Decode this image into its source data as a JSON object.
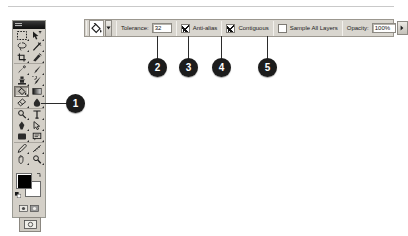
{
  "app": {
    "name": "Adobe Photoshop",
    "toolbox_title": "Toolbox"
  },
  "options_bar": {
    "tool_preset_icon": "paint-bucket-icon",
    "tool_preset_arrow_glyph": "▼",
    "tolerance": {
      "label": "Tolerance:",
      "value": "32"
    },
    "anti_alias": {
      "label": "Anti-alias",
      "checked": true
    },
    "contiguous": {
      "label": "Contiguous",
      "checked": true
    },
    "sample_all_layers": {
      "label": "Sample All Layers",
      "checked": false
    },
    "opacity": {
      "label": "Opacity:",
      "value": "100%",
      "arrow_glyph": "▶"
    }
  },
  "toolbox": {
    "selected_tool": "paint-bucket-tool",
    "groups": [
      {
        "rows": [
          {
            "tools": [
              "marquee-tool",
              "move-tool"
            ]
          },
          {
            "tools": [
              "lasso-tool",
              "magic-wand-tool"
            ]
          },
          {
            "tools": [
              "crop-tool",
              "slice-tool"
            ]
          }
        ]
      },
      {
        "rows": [
          {
            "tools": [
              "healing-brush-tool",
              "brush-tool"
            ]
          },
          {
            "tools": [
              "clone-stamp-tool",
              "history-brush-tool"
            ]
          },
          {
            "tools": [
              "paint-bucket-tool",
              "gradient-tool"
            ]
          },
          {
            "tools": [
              "eraser-tool",
              "blur-tool"
            ]
          }
        ]
      },
      {
        "rows": [
          {
            "tools": [
              "dodge-tool",
              "type-tool"
            ]
          },
          {
            "tools": [
              "pen-tool",
              "path-selection-tool"
            ]
          },
          {
            "tools": [
              "shape-tool",
              "notes-tool"
            ]
          }
        ]
      },
      {
        "rows": [
          {
            "tools": [
              "eyedropper-tool",
              "measure-tool"
            ]
          },
          {
            "tools": [
              "hand-tool",
              "zoom-tool"
            ]
          }
        ]
      }
    ],
    "foreground_color": "#000000",
    "background_color": "#ffffff",
    "quick_mask_icons": [
      "standard-mode-icon",
      "quick-mask-mode-icon"
    ],
    "screen_mode_icon": "screen-mode-icon"
  },
  "callouts": [
    {
      "number": "1",
      "target": "paint-bucket-tool"
    },
    {
      "number": "2",
      "target": "tolerance-field"
    },
    {
      "number": "3",
      "target": "anti-alias-checkbox"
    },
    {
      "number": "4",
      "target": "contiguous-checkbox"
    },
    {
      "number": "5",
      "target": "sample-all-layers-checkbox"
    }
  ],
  "colors": {
    "palette_face": "#d4d0c8",
    "options_face": "#d9d6cf",
    "border": "#9a9a93",
    "callout_bg": "#1c1c1c",
    "callout_fg": "#ffffff"
  }
}
